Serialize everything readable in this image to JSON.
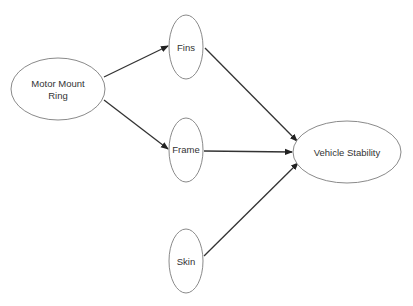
{
  "diagram": {
    "type": "directed-graph",
    "nodes": [
      {
        "id": "motor_mount_ring",
        "label_line1": "Motor Mount",
        "label_line2": "Ring",
        "cx": 58,
        "cy": 89,
        "rx": 47,
        "ry": 31
      },
      {
        "id": "fins",
        "label": "Fins",
        "cx": 186,
        "cy": 47,
        "rx": 17,
        "ry": 32
      },
      {
        "id": "frame",
        "label": "Frame",
        "cx": 186,
        "cy": 150,
        "rx": 17,
        "ry": 32
      },
      {
        "id": "skin",
        "label": "Skin",
        "cx": 186,
        "cy": 261,
        "rx": 17,
        "ry": 32
      },
      {
        "id": "vehicle_stability",
        "label": "Vehicle Stability",
        "cx": 347,
        "cy": 152,
        "rx": 54,
        "ry": 31
      }
    ],
    "edges": [
      {
        "from": "motor_mount_ring",
        "to": "fins"
      },
      {
        "from": "motor_mount_ring",
        "to": "frame"
      },
      {
        "from": "fins",
        "to": "vehicle_stability"
      },
      {
        "from": "frame",
        "to": "vehicle_stability"
      },
      {
        "from": "skin",
        "to": "vehicle_stability"
      }
    ],
    "colors": {
      "node_stroke": "#8a8a8a",
      "edge": "#333333",
      "text": "#333333",
      "background": "#ffffff"
    }
  }
}
